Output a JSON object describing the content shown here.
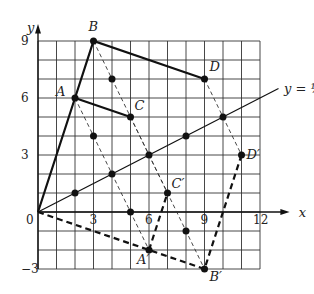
{
  "axes": {
    "x_label": "x",
    "y_label": "y",
    "x_ticks": [
      "0",
      "3",
      "6",
      "9",
      "12"
    ],
    "y_ticks": [
      "9",
      "6",
      "3",
      "−3"
    ]
  },
  "line_label": "y = ½x",
  "points": {
    "A": "A",
    "B": "B",
    "C": "C",
    "D": "D",
    "Ap": "A′",
    "Bp": "B′",
    "Cp": "C′",
    "Dp": "D′"
  },
  "chart_data": {
    "type": "diagram",
    "original": {
      "A": [
        2,
        6
      ],
      "B": [
        3,
        9
      ],
      "C": [
        5,
        5
      ],
      "D": [
        9,
        7
      ]
    },
    "image": {
      "A'": [
        6,
        -2
      ],
      "B'": [
        9,
        -3
      ],
      "C'": [
        7,
        1
      ],
      "D'": [
        11,
        3
      ]
    },
    "line": "y = 1/2 x",
    "grid": {
      "xrange": [
        0,
        12
      ],
      "yrange": [
        -3,
        9
      ]
    }
  }
}
